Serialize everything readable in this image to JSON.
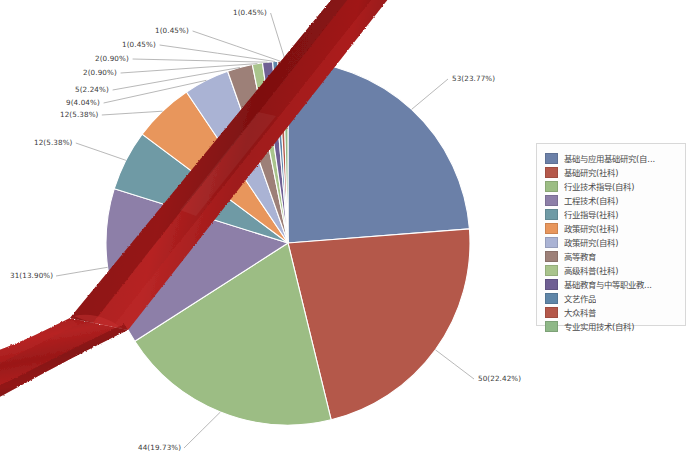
{
  "chart_data": {
    "type": "pie",
    "title": "",
    "legend_position": "right",
    "total": 223,
    "categories": [
      "基础与应用基础研究(自...",
      "基础研究(社科)",
      "行业技术指导(自科)",
      "工程技术(自科)",
      "行业指导(社科)",
      "政策研究(社科)",
      "政策研究(自科)",
      "高等教育",
      "高级科普(社科)",
      "基础教育与中等职业教...",
      "文艺作品",
      "大众科普",
      "专业实用技术(自科)"
    ],
    "values": [
      53,
      50,
      44,
      31,
      12,
      12,
      9,
      5,
      2,
      2,
      1,
      1,
      1
    ],
    "percents": [
      23.77,
      22.42,
      19.73,
      13.9,
      5.38,
      5.38,
      4.04,
      2.24,
      0.9,
      0.9,
      0.45,
      0.45,
      0.45
    ],
    "labels": [
      "53(23.77%)",
      "50(22.42%)",
      "44(19.73%)",
      "31(13.90%)",
      "12(5.38%)",
      "12(5.38%)",
      "9(4.04%)",
      "5(2.24%)",
      "2(0.90%)",
      "2(0.90%)",
      "1(0.45%)",
      "1(0.45%)",
      "1(0.45%)"
    ],
    "colors": [
      "#6b80a8",
      "#b4584a",
      "#9cbd84",
      "#8d7fa8",
      "#6f9aa5",
      "#e8965c",
      "#aab3d4",
      "#9d8078",
      "#a9c48c",
      "#6f5f93",
      "#5f86a8",
      "#b4584a",
      "#8fb888"
    ]
  },
  "legend": {
    "items": [
      {
        "label": "基础与应用基础研究(自...",
        "color": "#6b80a8"
      },
      {
        "label": "基础研究(社科)",
        "color": "#b4584a"
      },
      {
        "label": "行业技术指导(自科)",
        "color": "#9cbd84"
      },
      {
        "label": "工程技术(自科)",
        "color": "#8d7fa8"
      },
      {
        "label": "行业指导(社科)",
        "color": "#6f9aa5"
      },
      {
        "label": "政策研究(社科)",
        "color": "#e8965c"
      },
      {
        "label": "政策研究(自科)",
        "color": "#aab3d4"
      },
      {
        "label": "高等教育",
        "color": "#9d8078"
      },
      {
        "label": "高级科普(社科)",
        "color": "#a9c48c"
      },
      {
        "label": "基础教育与中等职业教...",
        "color": "#6f5f93"
      },
      {
        "label": "文艺作品",
        "color": "#5f86a8"
      },
      {
        "label": "大众科普",
        "color": "#b4584a"
      },
      {
        "label": "专业实用技术(自科)",
        "color": "#8fb888"
      }
    ]
  },
  "overlay": {
    "ribbon_color": "#9c1818",
    "ribbon_name": "red-ribbon"
  },
  "label_positions": [
    {
      "x": 452,
      "y": 74,
      "align": "left"
    },
    {
      "x": 478,
      "y": 374,
      "align": "left"
    },
    {
      "x": 138,
      "y": 443,
      "align": "left"
    },
    {
      "x": 10,
      "y": 271,
      "align": "left"
    },
    {
      "x": 34,
      "y": 138,
      "align": "left"
    },
    {
      "x": 60,
      "y": 110,
      "align": "left"
    },
    {
      "x": 66,
      "y": 98,
      "align": "left"
    },
    {
      "x": 75,
      "y": 85,
      "align": "left"
    },
    {
      "x": 83,
      "y": 68,
      "align": "left"
    },
    {
      "x": 95,
      "y": 54,
      "align": "left"
    },
    {
      "x": 122,
      "y": 40,
      "align": "left"
    },
    {
      "x": 155,
      "y": 26,
      "align": "left"
    },
    {
      "x": 233,
      "y": 8,
      "align": "left"
    }
  ]
}
